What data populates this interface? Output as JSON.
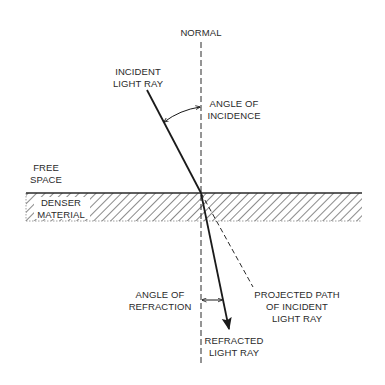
{
  "colors": {
    "ink": "#2a2a2a",
    "background": "#ffffff",
    "hatch": "#4a4a4a"
  },
  "labels": {
    "normal": "NORMAL",
    "incident": [
      "INCIDENT",
      "LIGHT RAY"
    ],
    "angle_of_incidence": [
      "ANGLE OF",
      "INCIDENCE"
    ],
    "free_space": [
      "FREE",
      "SPACE"
    ],
    "denser_material": [
      "DENSER",
      "MATERIAL"
    ],
    "angle_of_refraction": [
      "ANGLE OF",
      "REFRACTION"
    ],
    "projected_path": [
      "PROJECTED PATH",
      "OF INCIDENT",
      "LIGHT RAY"
    ],
    "refracted": [
      "REFRACTED",
      "LIGHT RAY"
    ]
  },
  "geometry": {
    "normal_x": 201,
    "normal_y_top": 42,
    "normal_y_bottom": 366,
    "surface_y": 193,
    "material_bottom_y": 221,
    "material_left_x": 26,
    "material_right_x": 362,
    "incident_start": [
      147,
      90
    ],
    "entry_point": [
      201,
      193
    ],
    "refracted_end": [
      229,
      329
    ],
    "projected_end": [
      253,
      287
    ]
  }
}
